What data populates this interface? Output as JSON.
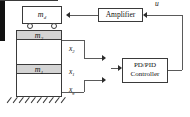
{
  "diagram": {
    "masses": {
      "damper": {
        "label": "m",
        "subscript": "d",
        "name": "mass-damper-cart"
      },
      "story2": {
        "label": "m",
        "subscript": "2",
        "name": "mass-second-story"
      },
      "story1": {
        "label": "m",
        "subscript": "1",
        "name": "mass-first-story"
      }
    },
    "signals": {
      "x2": {
        "label": "x",
        "subscript": "2"
      },
      "x1": {
        "label": "x",
        "subscript": "1"
      },
      "xg": {
        "label": "x",
        "subscript": "g"
      },
      "u": {
        "label": "u"
      }
    },
    "blocks": {
      "amplifier": {
        "label": "Amplifier"
      },
      "controller": {
        "line1": "PD/PID",
        "line2": "Controller"
      }
    },
    "colors": {
      "mass_band_fill": "#d4d4d4",
      "outline": "#3a3a3a",
      "sensor_bar": "#111111",
      "wire": "#5a5a5a",
      "background": "#ffffff"
    }
  }
}
